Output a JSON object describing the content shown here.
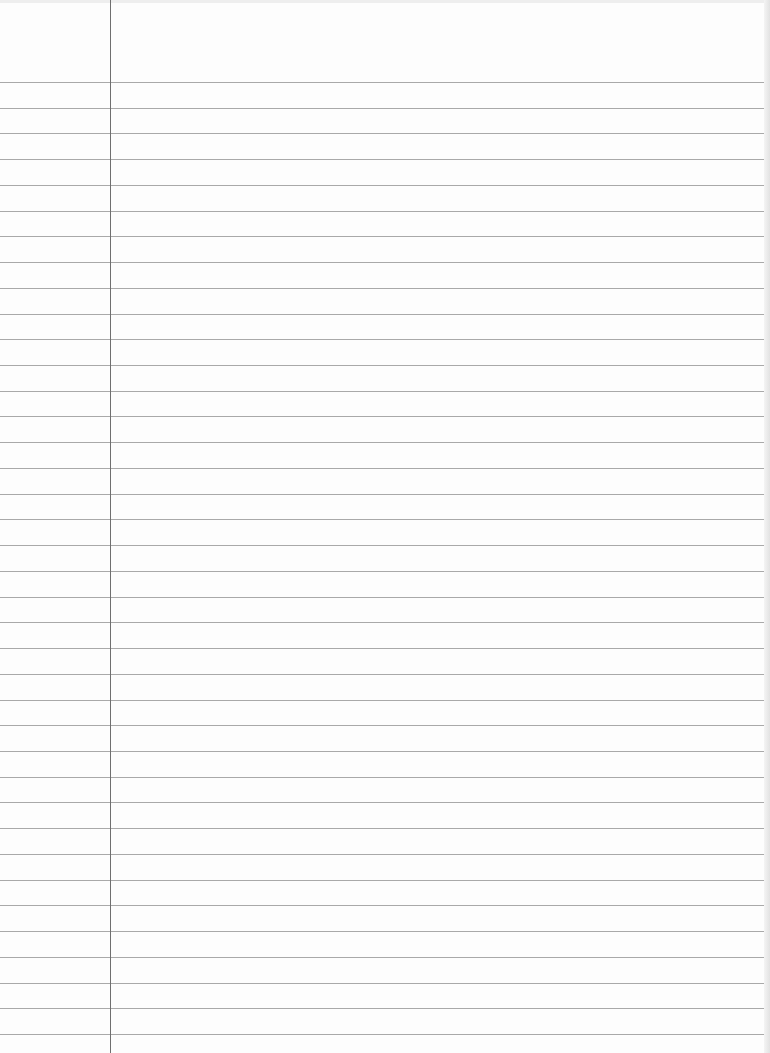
{
  "paper": {
    "type": "ruled-notebook-page",
    "background_color": "#fdfdfd",
    "rule_color": "#9a9a9a",
    "margin_color": "#6f6f6f",
    "margin_x": 110,
    "first_rule_y": 82,
    "rule_spacing": 25.73,
    "rule_count": 38
  }
}
